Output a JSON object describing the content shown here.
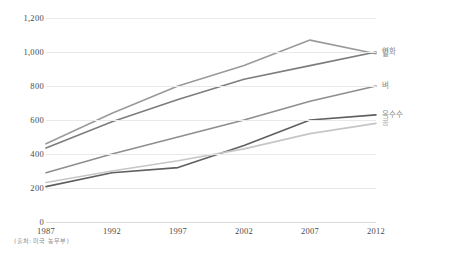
{
  "source_note": "(출처: 미국 농무부)",
  "chart_data": {
    "type": "line",
    "title": "",
    "xlabel": "",
    "ylabel": "",
    "x": [
      1987,
      1992,
      1997,
      2002,
      2007,
      2012
    ],
    "categories": [
      "1987",
      "1992",
      "1997",
      "2002",
      "2007",
      "2012"
    ],
    "xlim": [
      1987,
      2012
    ],
    "ylim": [
      0,
      1200
    ],
    "yticks": [
      0,
      200,
      400,
      600,
      800,
      1000,
      1200
    ],
    "ytick_labels": [
      "0",
      "200",
      "400",
      "600",
      "800",
      "1,000",
      "1,200"
    ],
    "grid": true,
    "legend_position": "right",
    "series": [
      {
        "name": "밀",
        "color": "#9a9a9a",
        "values": [
          460,
          640,
          800,
          920,
          1070,
          990
        ]
      },
      {
        "name": "연화",
        "color": "#7d7d7d",
        "values": [
          435,
          590,
          720,
          840,
          920,
          1000
        ]
      },
      {
        "name": "벼",
        "color": "#8e8e8e",
        "values": [
          290,
          400,
          500,
          600,
          710,
          800
        ]
      },
      {
        "name": "옥수수",
        "color": "#5f5f5f",
        "values": [
          208,
          290,
          320,
          450,
          600,
          630
        ]
      },
      {
        "name": "콩",
        "color": "#c6c6c6",
        "values": [
          232,
          300,
          360,
          430,
          520,
          580
        ]
      }
    ]
  }
}
